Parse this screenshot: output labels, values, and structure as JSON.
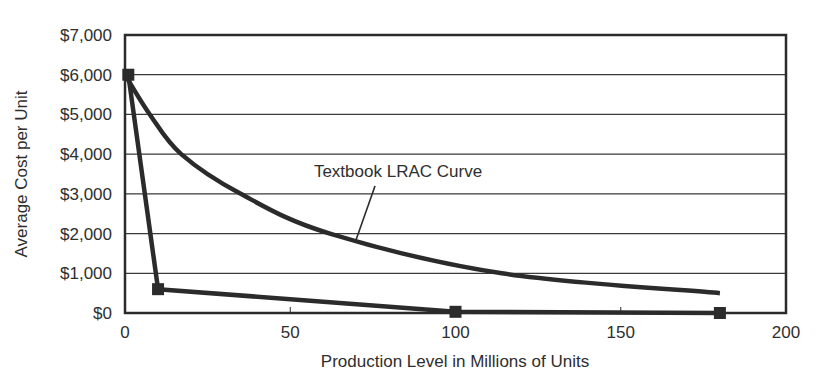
{
  "chart_data": {
    "type": "line",
    "title": "",
    "xlabel": "Production Level in Millions of Units",
    "ylabel": "Average Cost per Unit",
    "xlim": [
      0,
      200
    ],
    "ylim": [
      0,
      7000
    ],
    "x_ticks": [
      0,
      50,
      100,
      150,
      200
    ],
    "x_tick_labels": [
      "0",
      "50",
      "100",
      "150",
      "200"
    ],
    "y_ticks": [
      0,
      1000,
      2000,
      3000,
      4000,
      5000,
      6000,
      7000
    ],
    "y_tick_labels": [
      "$0",
      "$1,000",
      "$2,000",
      "$3,000",
      "$4,000",
      "$5,000",
      "$6,000",
      "$7,000"
    ],
    "grid": {
      "horizontal": true,
      "vertical": false
    },
    "legend": null,
    "series": [
      {
        "name": "Textbook LRAC Curve",
        "style": "smooth-curve",
        "markers": false,
        "x": [
          0,
          7.5,
          17,
          35,
          62,
          114,
          180
        ],
        "y": [
          6000,
          5000,
          4000,
          3000,
          2000,
          1000,
          500
        ]
      },
      {
        "name": "Observed average cost",
        "style": "line-with-square-markers",
        "markers": true,
        "x": [
          1,
          10,
          100,
          180
        ],
        "y": [
          6000,
          600,
          30,
          0
        ]
      }
    ],
    "annotations": [
      {
        "text": "Textbook LRAC Curve",
        "text_x": 72,
        "text_y": 3600,
        "points_to_x": 70,
        "points_to_y": 1900
      }
    ]
  },
  "colors": {
    "line": "#2b2b2b",
    "grid": "#3a3a3a",
    "text": "#2e2e2e",
    "background": "#ffffff"
  }
}
